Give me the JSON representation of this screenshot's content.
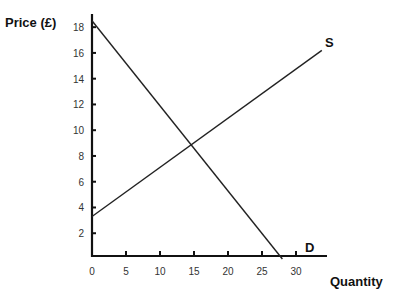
{
  "chart_data": {
    "type": "line",
    "title": "",
    "xlabel": "Quantity",
    "ylabel": "Price (£)",
    "xlim": [
      0,
      34
    ],
    "ylim": [
      0,
      19
    ],
    "x_ticks": [
      0,
      5,
      10,
      15,
      20,
      25,
      30
    ],
    "y_ticks": [
      2,
      4,
      6,
      8,
      10,
      12,
      14,
      16,
      18
    ],
    "grid": false,
    "legend": "none",
    "series": [
      {
        "name": "D",
        "label": "D",
        "points": [
          [
            0,
            18.5
          ],
          [
            28,
            0
          ]
        ]
      },
      {
        "name": "S",
        "label": "S",
        "points": [
          [
            0,
            3.3
          ],
          [
            33.8,
            16.2
          ]
        ]
      }
    ],
    "annotations": {
      "equilibrium": [
        15,
        9
      ]
    }
  },
  "labels": {
    "y_axis": "Price (£)",
    "x_axis": "Quantity",
    "supply": "S",
    "demand": "D"
  }
}
